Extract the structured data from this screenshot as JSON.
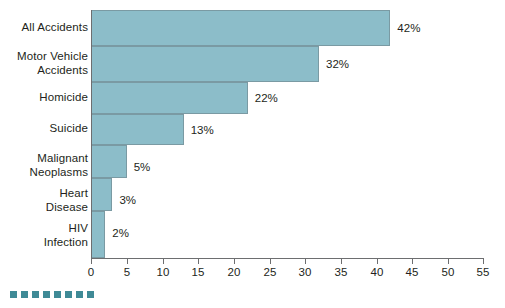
{
  "chart_data": {
    "type": "bar",
    "orientation": "horizontal",
    "title": "",
    "subtitle": "",
    "xlabel": "",
    "ylabel": "",
    "xlim": [
      0,
      55
    ],
    "xticks": [
      0,
      5,
      10,
      15,
      20,
      25,
      30,
      35,
      40,
      45,
      50,
      55
    ],
    "tick_labels": [
      "0",
      "5",
      "10",
      "15",
      "20",
      "25",
      "30",
      "35",
      "40",
      "45",
      "50",
      "55"
    ],
    "grid": false,
    "legend": null,
    "categories": [
      "All Accidents",
      "Motor Vehicle Accidents",
      "Homicide",
      "Suicide",
      "Malignant Neoplasms",
      "Heart Disease",
      "HIV Infection"
    ],
    "category_lines": [
      [
        "All Accidents"
      ],
      [
        "Motor Vehicle",
        "Accidents"
      ],
      [
        "Homicide"
      ],
      [
        "Suicide"
      ],
      [
        "Malignant",
        "Neoplasms"
      ],
      [
        "Heart",
        "Disease"
      ],
      [
        "HIV",
        "Infection"
      ]
    ],
    "values": [
      42,
      32,
      22,
      13,
      5,
      3,
      2
    ],
    "data_labels": [
      "42%",
      "32%",
      "22%",
      "13%",
      "5%",
      "3%",
      "2%"
    ],
    "bar_color": "#8cbdc9",
    "bar_border_color": "#7a9aa3",
    "axis_color": "#6d6e70",
    "text_color": "#231f20",
    "background": "#ffffff"
  },
  "decoration": {
    "name": "decorative-square-strip",
    "count": 8,
    "color": "#3f8a96"
  }
}
